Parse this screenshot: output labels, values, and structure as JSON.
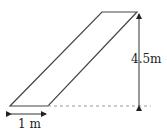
{
  "diagram": {
    "type": "parallelogram-ramp",
    "labels": {
      "height": "4.5m",
      "base": "1 m"
    },
    "colors": {
      "stroke": "#333333",
      "dashed": "#888888",
      "background": "#ffffff"
    }
  }
}
